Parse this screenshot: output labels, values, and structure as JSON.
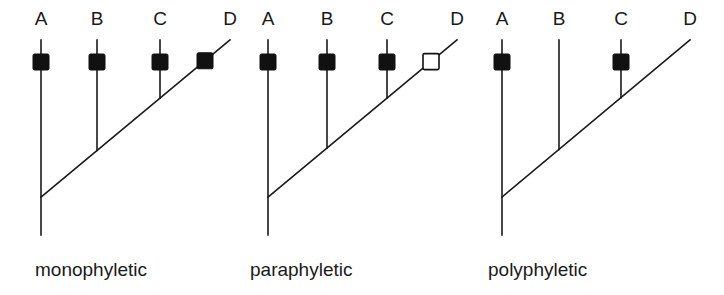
{
  "diagram": {
    "colors": {
      "line": "#1a1a1a",
      "filled_marker": "#111111",
      "hollow_marker": "#ffffff",
      "background": "#ffffff"
    },
    "trees": [
      {
        "id": "monophyletic",
        "caption": "monophyletic",
        "caption_x": 35,
        "taxa": [
          {
            "label": "A",
            "x": 41,
            "marker": "filled"
          },
          {
            "label": "B",
            "x": 97,
            "marker": "filled"
          },
          {
            "label": "C",
            "x": 160,
            "marker": "filled"
          },
          {
            "label": "D",
            "x": 230,
            "marker": "filled",
            "marker_x": 205
          }
        ]
      },
      {
        "id": "paraphyletic",
        "caption": "paraphyletic",
        "caption_x": 250,
        "taxa": [
          {
            "label": "A",
            "x": 268,
            "marker": "filled"
          },
          {
            "label": "B",
            "x": 327,
            "marker": "filled"
          },
          {
            "label": "C",
            "x": 387,
            "marker": "filled"
          },
          {
            "label": "D",
            "x": 457,
            "marker": "hollow",
            "marker_x": 431
          }
        ]
      },
      {
        "id": "polyphyletic",
        "caption": "polyphyletic",
        "caption_x": 488,
        "taxa": [
          {
            "label": "A",
            "x": 502,
            "marker": "filled"
          },
          {
            "label": "B",
            "x": 559,
            "marker": "none"
          },
          {
            "label": "C",
            "x": 621,
            "marker": "filled"
          },
          {
            "label": "D",
            "x": 690,
            "marker": "none"
          }
        ]
      }
    ]
  }
}
